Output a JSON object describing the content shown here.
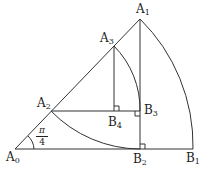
{
  "diagram": {
    "stroke_color": "#333333",
    "points": {
      "A0": {
        "label": "A",
        "sub": "0"
      },
      "A1": {
        "label": "A",
        "sub": "1"
      },
      "A2": {
        "label": "A",
        "sub": "2"
      },
      "A3": {
        "label": "A",
        "sub": "3"
      },
      "B1": {
        "label": "B",
        "sub": "1"
      },
      "B2": {
        "label": "B",
        "sub": "2"
      },
      "B3": {
        "label": "B",
        "sub": "3"
      },
      "B4": {
        "label": "B",
        "sub": "4"
      }
    },
    "angle": {
      "numerator": "π",
      "denominator": "4"
    }
  }
}
